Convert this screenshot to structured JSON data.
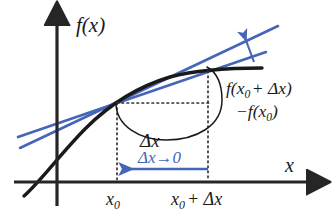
{
  "figure": {
    "axes": {
      "y_label": "f(x)",
      "x_label": "x",
      "axis_color": "#262626"
    },
    "tick_labels": {
      "x0": {
        "base": "x",
        "sub": "0"
      },
      "x0_plus_dx": {
        "base": "x",
        "sub": "0",
        "tail": "+ Δx"
      }
    },
    "annotations": {
      "delta_x": "Δx",
      "limit_arrow_label": "Δx→0",
      "rise_line1": {
        "prefix": "f(x",
        "sub": "0",
        "suffix": "+ Δx)"
      },
      "rise_line2": {
        "prefix": "−f(x",
        "sub": "0",
        "suffix": ")"
      }
    },
    "colors": {
      "curve": "#1a1a1a",
      "secant": "#4565b8",
      "tangent": "#4565b8",
      "limit_arrow": "#4565b8",
      "dotted": "#333333",
      "brace": "#1a1a1a",
      "text": "#1a1a1a",
      "text_blue": "#4565b8",
      "background": "#ffffff"
    },
    "geometry": {
      "origin": {
        "x": 57,
        "y": 182
      },
      "x_axis_end": {
        "x": 318,
        "y": 182
      },
      "y_axis_top": {
        "x": 57,
        "y": 14
      },
      "x0_tick": {
        "x": 117,
        "y": 182
      },
      "x0_plus_dx_tick": {
        "x": 208,
        "y": 182
      },
      "point_x0": {
        "x": 117,
        "y": 103
      },
      "point_x0_dx": {
        "x": 208,
        "y": 71
      },
      "curve_path": "M 24,196 C 40,182 62,152 86,128 C 110,104 140,86 170,77 C 196,70 230,68 262,68",
      "secant_line": {
        "x1": 18,
        "y1": 137,
        "x2": 266,
        "y2": 52
      },
      "tangent_line": {
        "x1": 20,
        "y1": 148,
        "x2": 278,
        "y2": 26
      },
      "limit_arrow": {
        "x1": 208,
        "y1": 168,
        "x2": 122,
        "y2": 168
      },
      "convergence_arrow": {
        "x1": 253,
        "y1": 61,
        "x2": 243,
        "y2": 36
      }
    }
  }
}
